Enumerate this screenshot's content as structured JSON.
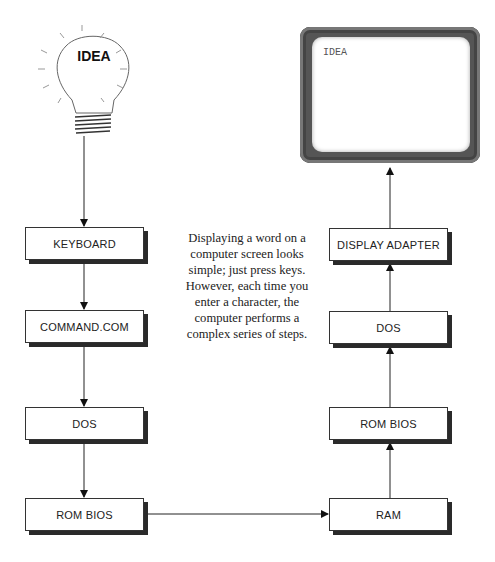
{
  "idea_bulb": {
    "label": "IDEA"
  },
  "monitor": {
    "screen_text": "IDEA"
  },
  "caption": {
    "lines": [
      "Displaying a word on a",
      "computer screen looks",
      "simple; just press keys.",
      "However, each time you",
      "enter a character, the",
      "computer performs a",
      "complex series of steps."
    ]
  },
  "left_column": [
    {
      "label": "KEYBOARD"
    },
    {
      "label": "COMMAND.COM"
    },
    {
      "label": "DOS"
    },
    {
      "label": "ROM BIOS"
    }
  ],
  "right_column": [
    {
      "label": "DISPLAY ADAPTER"
    },
    {
      "label": "DOS"
    },
    {
      "label": "ROM BIOS"
    },
    {
      "label": "RAM"
    }
  ],
  "colors": {
    "line": "#222222",
    "shadow": "#2a2a2a",
    "monitor_bezel": "#555555"
  }
}
